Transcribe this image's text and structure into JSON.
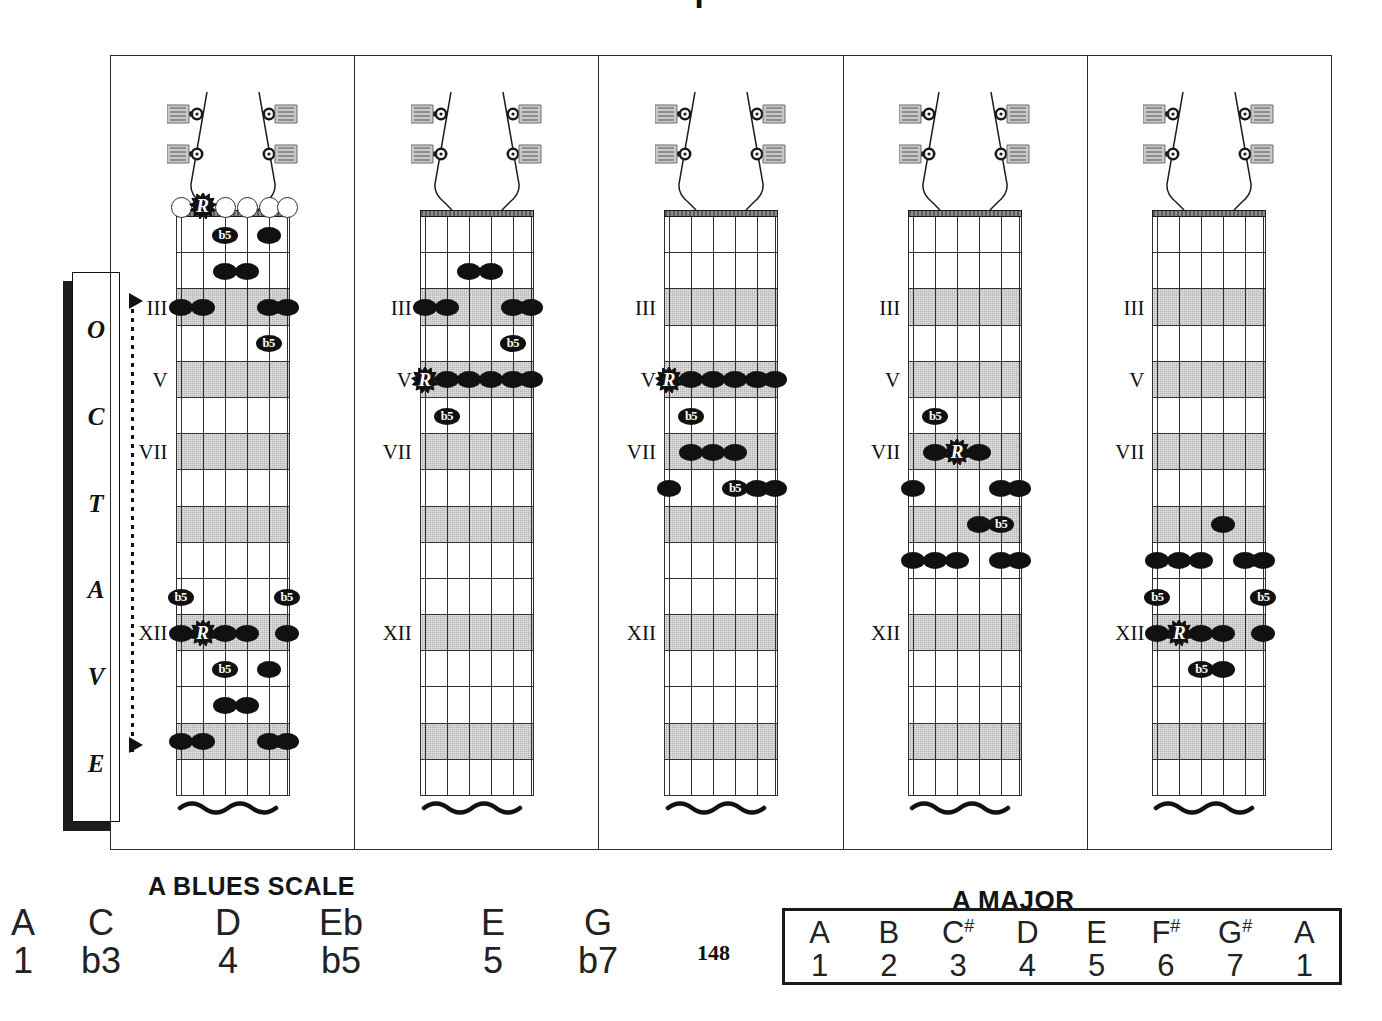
{
  "page": {
    "top_clipped_glyph": "I",
    "page_number": "148"
  },
  "octave_label": {
    "name": "OCTAVE",
    "letters": [
      "O",
      "C",
      "T",
      "A",
      "V",
      "E"
    ]
  },
  "fret_markers": [
    "III",
    "V",
    "VII",
    "XII"
  ],
  "markers_map": {
    "3": "III",
    "5": "V",
    "7": "VII",
    "12": "XII"
  },
  "shaded_frets": [
    3,
    5,
    7,
    9,
    12,
    15
  ],
  "labels": {
    "root": "R",
    "flat_five": "b5"
  },
  "blues": {
    "title": "A BLUES SCALE",
    "notes": [
      "A",
      "C",
      "D",
      "Eb",
      "E",
      "G"
    ],
    "degrees": [
      "1",
      "b3",
      "4",
      "b5",
      "5",
      "b7"
    ]
  },
  "major": {
    "title": "A MAJOR",
    "notes": [
      {
        "letter": "A",
        "accidental": ""
      },
      {
        "letter": "B",
        "accidental": ""
      },
      {
        "letter": "C",
        "accidental": "#"
      },
      {
        "letter": "D",
        "accidental": ""
      },
      {
        "letter": "E",
        "accidental": ""
      },
      {
        "letter": "F",
        "accidental": "#"
      },
      {
        "letter": "G",
        "accidental": "#"
      },
      {
        "letter": "A",
        "accidental": ""
      }
    ],
    "degrees": [
      "1",
      "2",
      "3",
      "4",
      "5",
      "6",
      "7",
      "1"
    ]
  },
  "colors": {
    "ink": "#111111",
    "shade": "#b6b6b6",
    "frame": "#2b2b2b",
    "paper": "#ffffff"
  },
  "diagrams": [
    {
      "id": 1,
      "position_name": "open-position",
      "show_headstock_open_strings": true,
      "open_strings": [
        6,
        4,
        3,
        2,
        1
      ],
      "open_root_string": 5,
      "notes": [
        {
          "fret": 1,
          "string": 4,
          "kind": "b5"
        },
        {
          "fret": 1,
          "string": 2,
          "kind": "dot"
        },
        {
          "fret": 2,
          "string": 4,
          "kind": "dot"
        },
        {
          "fret": 2,
          "string": 3,
          "kind": "dot"
        },
        {
          "fret": 3,
          "string": 6,
          "kind": "dot"
        },
        {
          "fret": 3,
          "string": 5,
          "kind": "dot"
        },
        {
          "fret": 3,
          "string": 2,
          "kind": "dot"
        },
        {
          "fret": 3,
          "string": 1,
          "kind": "dot"
        },
        {
          "fret": 4,
          "string": 2,
          "kind": "b5"
        },
        {
          "fret": 11,
          "string": 6,
          "kind": "b5"
        },
        {
          "fret": 11,
          "string": 1,
          "kind": "b5"
        },
        {
          "fret": 12,
          "string": 6,
          "kind": "dot"
        },
        {
          "fret": 12,
          "string": 5,
          "kind": "root"
        },
        {
          "fret": 12,
          "string": 4,
          "kind": "dot"
        },
        {
          "fret": 12,
          "string": 3,
          "kind": "dot"
        },
        {
          "fret": 12,
          "string": 1,
          "kind": "dot"
        },
        {
          "fret": 13,
          "string": 4,
          "kind": "b5"
        },
        {
          "fret": 13,
          "string": 2,
          "kind": "dot"
        },
        {
          "fret": 14,
          "string": 4,
          "kind": "dot"
        },
        {
          "fret": 14,
          "string": 3,
          "kind": "dot"
        },
        {
          "fret": 15,
          "string": 6,
          "kind": "dot"
        },
        {
          "fret": 15,
          "string": 5,
          "kind": "dot"
        },
        {
          "fret": 15,
          "string": 2,
          "kind": "dot"
        },
        {
          "fret": 15,
          "string": 1,
          "kind": "dot"
        }
      ]
    },
    {
      "id": 2,
      "position_name": "fifth-position",
      "show_headstock_open_strings": false,
      "open_strings": [],
      "open_root_string": null,
      "notes": [
        {
          "fret": 2,
          "string": 4,
          "kind": "dot"
        },
        {
          "fret": 2,
          "string": 3,
          "kind": "dot"
        },
        {
          "fret": 3,
          "string": 6,
          "kind": "dot"
        },
        {
          "fret": 3,
          "string": 5,
          "kind": "dot"
        },
        {
          "fret": 3,
          "string": 2,
          "kind": "dot"
        },
        {
          "fret": 3,
          "string": 1,
          "kind": "dot"
        },
        {
          "fret": 4,
          "string": 2,
          "kind": "b5"
        },
        {
          "fret": 5,
          "string": 6,
          "kind": "root"
        },
        {
          "fret": 5,
          "string": 5,
          "kind": "dot"
        },
        {
          "fret": 5,
          "string": 4,
          "kind": "dot"
        },
        {
          "fret": 5,
          "string": 3,
          "kind": "dot"
        },
        {
          "fret": 5,
          "string": 2,
          "kind": "dot"
        },
        {
          "fret": 5,
          "string": 1,
          "kind": "dot"
        },
        {
          "fret": 6,
          "string": 5,
          "kind": "b5"
        }
      ]
    },
    {
      "id": 3,
      "position_name": "fifth-to-eighth-position",
      "show_headstock_open_strings": false,
      "open_strings": [],
      "open_root_string": null,
      "notes": [
        {
          "fret": 5,
          "string": 6,
          "kind": "root"
        },
        {
          "fret": 5,
          "string": 5,
          "kind": "dot"
        },
        {
          "fret": 5,
          "string": 4,
          "kind": "dot"
        },
        {
          "fret": 5,
          "string": 3,
          "kind": "dot"
        },
        {
          "fret": 5,
          "string": 2,
          "kind": "dot"
        },
        {
          "fret": 5,
          "string": 1,
          "kind": "dot"
        },
        {
          "fret": 6,
          "string": 5,
          "kind": "b5"
        },
        {
          "fret": 7,
          "string": 5,
          "kind": "dot"
        },
        {
          "fret": 7,
          "string": 4,
          "kind": "dot"
        },
        {
          "fret": 7,
          "string": 3,
          "kind": "dot"
        },
        {
          "fret": 8,
          "string": 6,
          "kind": "dot"
        },
        {
          "fret": 8,
          "string": 3,
          "kind": "b5"
        },
        {
          "fret": 8,
          "string": 2,
          "kind": "dot"
        },
        {
          "fret": 8,
          "string": 1,
          "kind": "dot"
        }
      ]
    },
    {
      "id": 4,
      "position_name": "seventh-position",
      "show_headstock_open_strings": false,
      "open_strings": [],
      "open_root_string": null,
      "notes": [
        {
          "fret": 6,
          "string": 5,
          "kind": "b5"
        },
        {
          "fret": 7,
          "string": 5,
          "kind": "dot"
        },
        {
          "fret": 7,
          "string": 4,
          "kind": "root"
        },
        {
          "fret": 7,
          "string": 3,
          "kind": "dot"
        },
        {
          "fret": 8,
          "string": 6,
          "kind": "dot"
        },
        {
          "fret": 8,
          "string": 2,
          "kind": "dot"
        },
        {
          "fret": 8,
          "string": 1,
          "kind": "dot"
        },
        {
          "fret": 9,
          "string": 3,
          "kind": "dot"
        },
        {
          "fret": 9,
          "string": 2,
          "kind": "b5"
        },
        {
          "fret": 10,
          "string": 6,
          "kind": "dot"
        },
        {
          "fret": 10,
          "string": 5,
          "kind": "dot"
        },
        {
          "fret": 10,
          "string": 4,
          "kind": "dot"
        },
        {
          "fret": 10,
          "string": 2,
          "kind": "dot"
        },
        {
          "fret": 10,
          "string": 1,
          "kind": "dot"
        }
      ]
    },
    {
      "id": 5,
      "position_name": "twelfth-position",
      "show_headstock_open_strings": false,
      "open_strings": [],
      "open_root_string": null,
      "notes": [
        {
          "fret": 9,
          "string": 3,
          "kind": "dot"
        },
        {
          "fret": 10,
          "string": 6,
          "kind": "dot"
        },
        {
          "fret": 10,
          "string": 5,
          "kind": "dot"
        },
        {
          "fret": 10,
          "string": 4,
          "kind": "dot"
        },
        {
          "fret": 10,
          "string": 2,
          "kind": "dot"
        },
        {
          "fret": 10,
          "string": 1,
          "kind": "dot"
        },
        {
          "fret": 11,
          "string": 6,
          "kind": "b5"
        },
        {
          "fret": 11,
          "string": 1,
          "kind": "b5"
        },
        {
          "fret": 12,
          "string": 6,
          "kind": "dot"
        },
        {
          "fret": 12,
          "string": 5,
          "kind": "root"
        },
        {
          "fret": 12,
          "string": 4,
          "kind": "dot"
        },
        {
          "fret": 12,
          "string": 3,
          "kind": "dot"
        },
        {
          "fret": 12,
          "string": 1,
          "kind": "dot"
        },
        {
          "fret": 13,
          "string": 4,
          "kind": "b5"
        },
        {
          "fret": 13,
          "string": 3,
          "kind": "dot"
        }
      ]
    }
  ]
}
